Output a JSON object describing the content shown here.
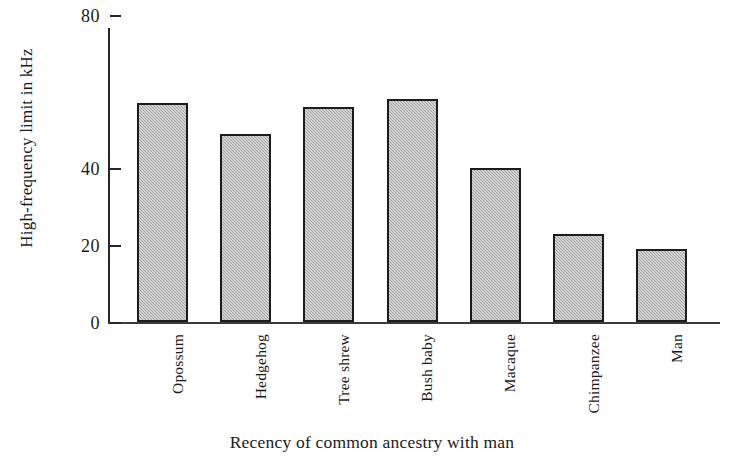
{
  "chart_data": {
    "type": "bar",
    "title": "",
    "xlabel": "Recency of common ancestry with man",
    "ylabel": "High-frequency limit in kHz",
    "categories": [
      "Opossum",
      "Hedgehog",
      "Tree shrew",
      "Bush baby",
      "Macaque",
      "Chimpanzee",
      "Man"
    ],
    "values": [
      57.0,
      49.0,
      56.0,
      58.0,
      40.0,
      23.0,
      19.0
    ],
    "value_unit": "kHz",
    "ylim": [
      0,
      88
    ],
    "ytick_values": [
      0,
      20,
      40,
      80
    ],
    "ytick_labels": [
      "0",
      "20",
      "40",
      "80"
    ],
    "grid": false,
    "legend": false,
    "series": [
      {
        "name": "High-frequency limit",
        "values": [
          57.0,
          49.0,
          56.0,
          58.0,
          40.0,
          23.0,
          19.0
        ]
      }
    ],
    "bar_fill_color": "#b4b4b4",
    "bar_edge_color": "#1c1c1c",
    "axis_color": "#262626",
    "background_color": "#ffffff"
  },
  "axis": {
    "y_title": "High-frequency limit in kHz",
    "x_title": "Recency of common ancestry with man"
  },
  "ticks": [
    {
      "label": "0",
      "value": 0
    },
    {
      "label": "20",
      "value": 20
    },
    {
      "label": "40",
      "value": 40
    },
    {
      "label": "80",
      "value": 80
    }
  ],
  "bars": [
    {
      "label": "Opossum",
      "value": 57.0
    },
    {
      "label": "Hedgehog",
      "value": 49.0
    },
    {
      "label": "Tree shrew",
      "value": 56.0
    },
    {
      "label": "Bush baby",
      "value": 58.0
    },
    {
      "label": "Macaque",
      "value": 40.0
    },
    {
      "label": "Chimpanzee",
      "value": 23.0
    },
    {
      "label": "Man",
      "value": 19.0
    }
  ]
}
